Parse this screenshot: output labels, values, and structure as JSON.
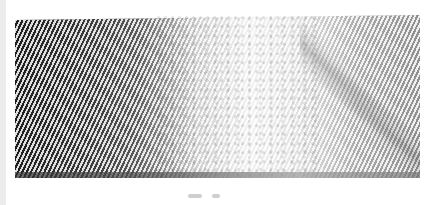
{
  "image": {
    "description": "Grayscale scan of a diagonally striated textured surface",
    "colors": {
      "dark_region": "#1e1e1e",
      "light_region": "#f2f2f2",
      "right_region": "#8f8f8f",
      "background": "#ffffff"
    },
    "regions": [
      {
        "name": "dark-striated-left",
        "tone": "dark"
      },
      {
        "name": "speckled-center",
        "tone": "light"
      },
      {
        "name": "gray-striated-right",
        "tone": "medium"
      }
    ]
  }
}
